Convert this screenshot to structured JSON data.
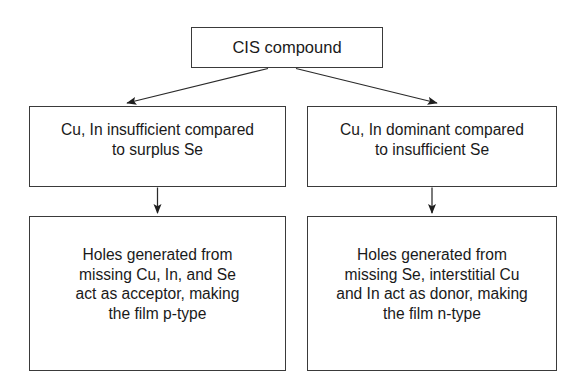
{
  "diagram": {
    "type": "flowchart",
    "background_color": "#ffffff",
    "line_color": "#3a3a3a",
    "text_color": "#1a1a1a",
    "nodes": {
      "root": {
        "id": "cis-compound",
        "label": "CIS compound"
      },
      "mid_left": {
        "id": "cu-in-insufficient",
        "label": "Cu, In insufficient compared\nto surplus Se"
      },
      "mid_right": {
        "id": "cu-in-dominant",
        "label": "Cu, In dominant compared\nto insufficient Se"
      },
      "bottom_left": {
        "id": "p-type-result",
        "label": "Holes generated from\nmissing Cu, In, and Se\nact as acceptor, making\nthe film p-type"
      },
      "bottom_right": {
        "id": "n-type-result",
        "label": "Holes generated from\nmissing Se, interstitial Cu\nand In act as donor, making\nthe film n-type"
      }
    },
    "edges": [
      {
        "id": "edge-root-to-mid-left",
        "from": "cis-compound",
        "to": "cu-in-insufficient",
        "style": "diagonal-arrow"
      },
      {
        "id": "edge-root-to-mid-right",
        "from": "cis-compound",
        "to": "cu-in-dominant",
        "style": "diagonal-arrow"
      },
      {
        "id": "edge-mid-left-to-bottom-left",
        "from": "cu-in-insufficient",
        "to": "p-type-result",
        "style": "vertical-arrow"
      },
      {
        "id": "edge-mid-right-to-bottom-right",
        "from": "cu-in-dominant",
        "to": "n-type-result",
        "style": "vertical-arrow"
      }
    ]
  }
}
